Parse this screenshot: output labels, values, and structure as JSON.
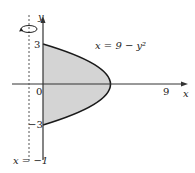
{
  "diagram": {
    "curve_label": "x = 9 − y²",
    "x_axis_label": "x",
    "y_axis_label": "y",
    "origin_label": "0",
    "x_tick_label": "9",
    "y_top_label": "3",
    "y_bottom_label": "−3",
    "axis_of_rotation_label": "x = −1",
    "colors": {
      "region_fill": "#d4d4d4",
      "curve": "#1a1a1a",
      "axes": "#333333",
      "dashed_line": "#555555"
    }
  }
}
